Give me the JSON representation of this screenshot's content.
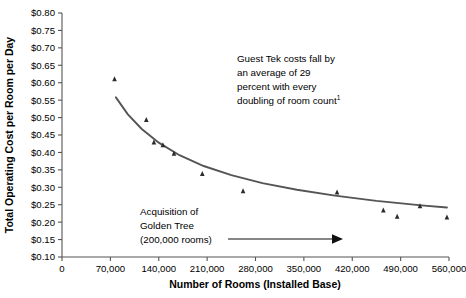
{
  "chart_data": {
    "type": "scatter",
    "title": "",
    "xlabel": "Number of Rooms (Installed Base)",
    "ylabel": "Total Operating Cost per Room per Day",
    "xlim": [
      0,
      560000
    ],
    "ylim": [
      0.1,
      0.8
    ],
    "grid": false,
    "legend": "none",
    "xticks": [
      "0",
      "70,000",
      "140,000",
      "210,000",
      "280,000",
      "350,000",
      "420,000",
      "490,000",
      "560,000"
    ],
    "xtick_values": [
      0,
      70000,
      140000,
      210000,
      280000,
      350000,
      420000,
      490000,
      560000
    ],
    "yticks": [
      "$0.10",
      "$0.15",
      "$0.20",
      "$0.25",
      "$0.30",
      "$0.35",
      "$0.40",
      "$0.45",
      "$0.50",
      "$0.55",
      "$0.60",
      "$0.65",
      "$0.70",
      "$0.75",
      "$0.80"
    ],
    "ytick_values": [
      0.1,
      0.15,
      0.2,
      0.25,
      0.3,
      0.35,
      0.4,
      0.45,
      0.5,
      0.55,
      0.6,
      0.65,
      0.7,
      0.75,
      0.8
    ],
    "series": [
      {
        "name": "Total operating cost per room per day",
        "marker": "triangle",
        "color": "#2b2b2b",
        "x": [
          76000,
          122000,
          133000,
          146000,
          162000,
          203000,
          262000,
          398000,
          465000,
          485000,
          518000,
          557000
        ],
        "y": [
          0.61,
          0.493,
          0.428,
          0.42,
          0.396,
          0.338,
          0.288,
          0.285,
          0.233,
          0.215,
          0.245,
          0.213
        ]
      }
    ],
    "trendline": {
      "name": "power-law fit",
      "color": "#5a5a5a",
      "x": [
        78000,
        95000,
        115000,
        140000,
        170000,
        205000,
        245000,
        290000,
        340000,
        395000,
        455000,
        520000,
        557000
      ],
      "y": [
        0.558,
        0.51,
        0.468,
        0.428,
        0.392,
        0.361,
        0.335,
        0.312,
        0.293,
        0.276,
        0.261,
        0.248,
        0.242
      ]
    },
    "annotations": [
      {
        "name": "guest-tek-note",
        "lines": [
          "Guest Tek costs fall by",
          "an average of 29",
          "percent with every",
          "doubling of room count"
        ],
        "superscript": "1"
      },
      {
        "name": "acquisition-note",
        "lines": [
          "Acquisition of",
          "Golden Tree",
          "(200,000 rooms)"
        ],
        "superscript": ""
      }
    ]
  }
}
